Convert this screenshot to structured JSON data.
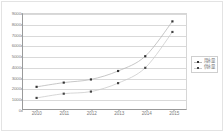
{
  "chart_data": {
    "type": "line",
    "title": "",
    "subtitle": "",
    "xlabel": "",
    "ylabel": "",
    "categories": [
      "2010",
      "2011",
      "2012",
      "2013",
      "2014",
      "2015"
    ],
    "ylim": [
      0,
      9000
    ],
    "yticks": [
      "0",
      "1000",
      "2000",
      "3000",
      "4000",
      "5000",
      "6000",
      "7000",
      "8000",
      "9000"
    ],
    "grid": true,
    "legend_position": "right",
    "series": [
      {
        "name": "用水量",
        "color": "#b9b9b9",
        "marker": "square",
        "marker_color": "#333333",
        "values": [
          2100,
          2500,
          2800,
          3600,
          5000,
          8300
        ]
      },
      {
        "name": "供水量",
        "color": "#cccccc",
        "marker": "square",
        "marker_color": "#444444",
        "values": [
          1050,
          1450,
          1650,
          2450,
          3900,
          7300
        ]
      }
    ]
  },
  "colors": {
    "axis": "#9a9a9a",
    "grid": "#d9d9d9",
    "frame": "#e3e3e3",
    "tick_text": "#7a7a7a",
    "legend_text": "#6f6f6f"
  }
}
